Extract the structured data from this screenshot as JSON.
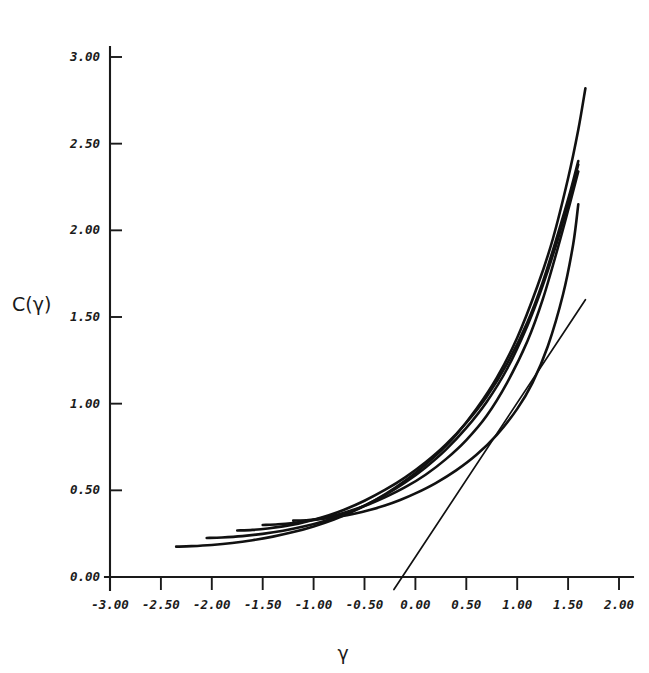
{
  "chart_data": {
    "type": "line",
    "title": "",
    "xlabel": "γ",
    "ylabel": "C(γ)",
    "xlim": [
      -3.0,
      2.0
    ],
    "ylim": [
      0.0,
      3.0
    ],
    "grid": false,
    "legend": "none",
    "xticks": [
      -3.0,
      -2.5,
      -2.0,
      -1.5,
      -1.0,
      -0.5,
      0.0,
      0.5,
      1.0,
      1.5,
      2.0
    ],
    "yticks": [
      0.0,
      0.5,
      1.0,
      1.5,
      2.0,
      2.5,
      3.0
    ],
    "xtick_labels": [
      "-3.00",
      "-2.50",
      "-2.00",
      "-1.50",
      "-1.00",
      "-0.50",
      "0.00",
      "0.50",
      "1.00",
      "1.50",
      "2.00"
    ],
    "ytick_labels": [
      "0.00",
      "0.50",
      "1.00",
      "1.50",
      "2.00",
      "2.50",
      "3.00"
    ],
    "annotations": [],
    "series": [
      {
        "name": "curve-1",
        "x": [
          -2.35,
          -2.2,
          -2.0,
          -1.8,
          -1.6,
          -1.4,
          -1.2,
          -1.0,
          -0.8,
          -0.6,
          -0.4,
          -0.2,
          0.0,
          0.2,
          0.4,
          0.6,
          0.8,
          1.0,
          1.2,
          1.35,
          1.5,
          1.6,
          1.67
        ],
        "y": [
          0.175,
          0.178,
          0.185,
          0.196,
          0.212,
          0.233,
          0.259,
          0.292,
          0.332,
          0.382,
          0.442,
          0.515,
          0.6,
          0.7,
          0.82,
          0.97,
          1.15,
          1.38,
          1.68,
          1.95,
          2.3,
          2.58,
          2.82
        ]
      },
      {
        "name": "curve-2",
        "x": [
          -2.05,
          -1.9,
          -1.7,
          -1.5,
          -1.3,
          -1.1,
          -0.9,
          -0.7,
          -0.5,
          -0.3,
          -0.1,
          0.1,
          0.3,
          0.5,
          0.7,
          0.9,
          1.1,
          1.25,
          1.4,
          1.52,
          1.6
        ],
        "y": [
          0.225,
          0.228,
          0.236,
          0.249,
          0.267,
          0.291,
          0.322,
          0.362,
          0.412,
          0.472,
          0.545,
          0.632,
          0.735,
          0.86,
          1.01,
          1.2,
          1.45,
          1.68,
          1.95,
          2.2,
          2.38
        ]
      },
      {
        "name": "curve-3",
        "x": [
          -1.75,
          -1.6,
          -1.45,
          -1.3,
          -1.15,
          -1.0,
          -0.85,
          -0.7,
          -0.5,
          -0.3,
          -0.1,
          0.1,
          0.3,
          0.5,
          0.7,
          0.9,
          1.1,
          1.25,
          1.4,
          1.52,
          1.6
        ],
        "y": [
          0.268,
          0.272,
          0.28,
          0.292,
          0.308,
          0.33,
          0.356,
          0.388,
          0.44,
          0.502,
          0.575,
          0.662,
          0.765,
          0.89,
          1.04,
          1.23,
          1.47,
          1.7,
          1.98,
          2.22,
          2.4
        ]
      },
      {
        "name": "curve-4",
        "x": [
          -1.5,
          -1.35,
          -1.2,
          -1.05,
          -0.9,
          -0.75,
          -0.6,
          -0.45,
          -0.3,
          -0.1,
          0.1,
          0.3,
          0.5,
          0.7,
          0.9,
          1.1,
          1.25,
          1.4,
          1.52,
          1.6
        ],
        "y": [
          0.3,
          0.304,
          0.312,
          0.324,
          0.341,
          0.362,
          0.389,
          0.421,
          0.459,
          0.518,
          0.59,
          0.68,
          0.79,
          0.93,
          1.12,
          1.36,
          1.6,
          1.9,
          2.16,
          2.34
        ]
      },
      {
        "name": "curve-5",
        "x": [
          -1.2,
          -1.05,
          -0.9,
          -0.75,
          -0.6,
          -0.45,
          -0.3,
          -0.15,
          0.0,
          0.2,
          0.4,
          0.6,
          0.8,
          1.0,
          1.15,
          1.3,
          1.45,
          1.55,
          1.6
        ],
        "y": [
          0.325,
          0.329,
          0.337,
          0.349,
          0.365,
          0.386,
          0.412,
          0.444,
          0.482,
          0.542,
          0.615,
          0.705,
          0.82,
          0.97,
          1.12,
          1.33,
          1.63,
          1.92,
          2.15
        ]
      }
    ],
    "tangent_line": {
      "name": "tangent-line",
      "x": [
        -0.13,
        1.67
      ],
      "y": [
        0.0,
        1.6
      ]
    }
  },
  "axes": {
    "y_title": "C(γ)",
    "x_title": "γ"
  }
}
